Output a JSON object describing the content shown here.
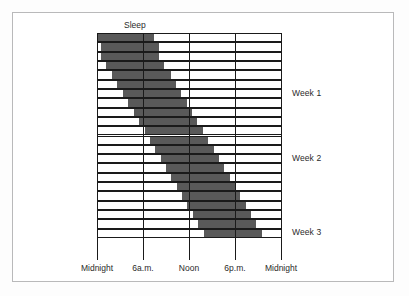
{
  "figure": {
    "kind": "actogram",
    "series_label": "Sleep",
    "background_color": "#ffffff",
    "bar_color": "#595959",
    "line_color": "#1a1a1a",
    "border_color": "#b9b9ba"
  },
  "axis": {
    "x_ticks": [
      {
        "label": "Midnight",
        "hour": 0
      },
      {
        "label": "6a.m.",
        "hour": 6
      },
      {
        "label": "Noon",
        "hour": 12
      },
      {
        "label": "6p.m.",
        "hour": 18
      },
      {
        "label": "Midnight",
        "hour": 24
      }
    ],
    "x_range_hours": [
      0,
      24
    ],
    "y_labels": [
      {
        "label": "Week 1",
        "row_index": 6
      },
      {
        "label": "Week 2",
        "row_index": 13
      },
      {
        "label": "Week 3",
        "row_index": 21
      }
    ]
  },
  "chart_data": {
    "type": "bar",
    "subtype": "actogram-double-free-running-sleep-chart",
    "title": "Sleep",
    "xlabel": "",
    "ylabel": "",
    "xlim": [
      0,
      24
    ],
    "x_tick_values": [
      0,
      6,
      12,
      18,
      24
    ],
    "x_tick_labels": [
      "Midnight",
      "6a.m.",
      "Noon",
      "6p.m.",
      "Midnight"
    ],
    "categories": [
      "Day 1",
      "Day 2",
      "Day 3",
      "Day 4",
      "Day 5",
      "Day 6",
      "Day 7",
      "Day 8",
      "Day 9",
      "Day 10",
      "Day 11",
      "Day 12",
      "Day 13",
      "Day 14",
      "Day 15",
      "Day 16",
      "Day 17",
      "Day 18",
      "Day 19",
      "Day 20",
      "Day 21",
      "Day 22"
    ],
    "row_labels_right": [
      "Week 1",
      "Week 2",
      "Week 3"
    ],
    "legend": [
      "Sleep"
    ],
    "grid": true,
    "legend_position": "top",
    "units": "hours of day",
    "note": "Each horizontal row is one day; shaded block marks the sleep episode, which drifts later each successive day (free-running rhythm longer than 24 h).",
    "series": [
      {
        "name": "Sleep",
        "color": "#595959",
        "bars": [
          {
            "day": 1,
            "start_hour": 0.0,
            "end_hour": 7.4
          },
          {
            "day": 2,
            "start_hour": 0.5,
            "end_hour": 8.1
          },
          {
            "day": 3,
            "start_hour": 0.5,
            "end_hour": 8.1
          },
          {
            "day": 4,
            "start_hour": 1.2,
            "end_hour": 8.8
          },
          {
            "day": 5,
            "start_hour": 2.0,
            "end_hour": 9.6
          },
          {
            "day": 6,
            "start_hour": 2.6,
            "end_hour": 10.3
          },
          {
            "day": 7,
            "start_hour": 3.4,
            "end_hour": 11.0
          },
          {
            "day": 8,
            "start_hour": 4.1,
            "end_hour": 11.7
          },
          {
            "day": 9,
            "start_hour": 4.8,
            "end_hour": 12.4
          },
          {
            "day": 10,
            "start_hour": 5.5,
            "end_hour": 13.1
          },
          {
            "day": 11,
            "start_hour": 6.2,
            "end_hour": 13.8
          },
          {
            "day": 12,
            "start_hour": 6.9,
            "end_hour": 14.5
          },
          {
            "day": 13,
            "start_hour": 7.6,
            "end_hour": 15.2
          },
          {
            "day": 14,
            "start_hour": 8.3,
            "end_hour": 15.9
          },
          {
            "day": 15,
            "start_hour": 9.0,
            "end_hour": 16.6
          },
          {
            "day": 16,
            "start_hour": 9.7,
            "end_hour": 17.3
          },
          {
            "day": 17,
            "start_hour": 10.4,
            "end_hour": 18.0
          },
          {
            "day": 18,
            "start_hour": 11.1,
            "end_hour": 18.7
          },
          {
            "day": 19,
            "start_hour": 11.8,
            "end_hour": 19.4
          },
          {
            "day": 20,
            "start_hour": 12.5,
            "end_hour": 20.1
          },
          {
            "day": 21,
            "start_hour": 13.2,
            "end_hour": 20.8
          },
          {
            "day": 22,
            "start_hour": 13.9,
            "end_hour": 21.5
          }
        ]
      }
    ]
  }
}
